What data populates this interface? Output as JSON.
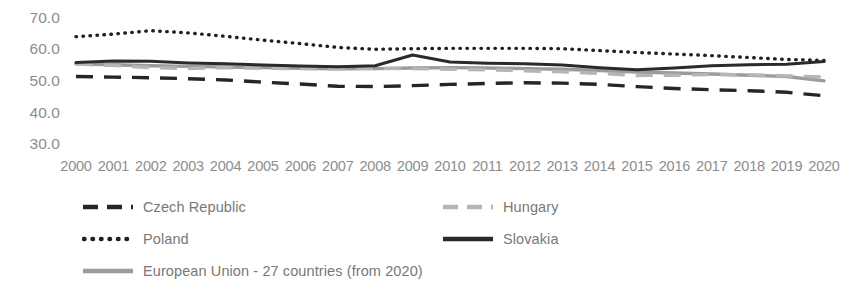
{
  "chart_data": {
    "type": "line",
    "title": "",
    "subtitle": "",
    "xlabel": "",
    "ylabel": "",
    "grid": false,
    "legend_position": "bottom",
    "ylim": [
      30.0,
      70.0
    ],
    "ytick_labels": [
      "70.0",
      "60.0",
      "50.0",
      "40.0",
      "30.0"
    ],
    "ytick_values": [
      70.0,
      60.0,
      50.0,
      40.0,
      30.0
    ],
    "categories": [
      "2000",
      "2001",
      "2002",
      "2003",
      "2004",
      "2005",
      "2006",
      "2007",
      "2008",
      "2009",
      "2010",
      "2011",
      "2012",
      "2013",
      "2014",
      "2015",
      "2016",
      "2017",
      "2018",
      "2019",
      "2020"
    ],
    "x": [
      2000,
      2001,
      2002,
      2003,
      2004,
      2005,
      2006,
      2007,
      2008,
      2009,
      2010,
      2011,
      2012,
      2013,
      2014,
      2015,
      2016,
      2017,
      2018,
      2019,
      2020
    ],
    "series": [
      {
        "name": "Czech Republic",
        "style": "dashed",
        "color": "#262626",
        "width": 3.4,
        "values": [
          51.4,
          51.2,
          51.0,
          50.7,
          50.3,
          49.6,
          49.0,
          48.3,
          48.2,
          48.5,
          48.9,
          49.2,
          49.4,
          49.3,
          48.9,
          48.2,
          47.6,
          47.2,
          46.9,
          46.4,
          45.3
        ]
      },
      {
        "name": "Hungary",
        "style": "dashed",
        "color": "#b5b5b5",
        "width": 3.4,
        "values": [
          55.3,
          54.9,
          54.2,
          53.9,
          54.2,
          54.0,
          53.9,
          53.8,
          54.0,
          53.9,
          53.7,
          53.5,
          53.2,
          52.9,
          52.4,
          51.7,
          51.8,
          52.0,
          51.9,
          51.6,
          51.2
        ]
      },
      {
        "name": "Poland",
        "style": "dotted",
        "color": "#1f1f1f",
        "width": 3.4,
        "values": [
          64.0,
          64.8,
          65.9,
          65.2,
          64.1,
          62.9,
          61.8,
          60.6,
          60.0,
          60.2,
          60.3,
          60.3,
          60.3,
          60.2,
          59.6,
          59.0,
          58.5,
          58.0,
          57.4,
          56.8,
          56.5
        ]
      },
      {
        "name": "Slovakia",
        "style": "solid",
        "color": "#2a2a2a",
        "width": 3.0,
        "values": [
          55.8,
          56.3,
          56.2,
          55.7,
          55.4,
          55.0,
          54.7,
          54.5,
          54.8,
          58.2,
          56.0,
          55.6,
          55.4,
          55.0,
          54.2,
          53.5,
          54.1,
          54.8,
          55.1,
          55.3,
          56.1
        ]
      },
      {
        "name": "European Union - 27 countries (from 2020)",
        "style": "solid",
        "color": "#9b9b9b",
        "width": 3.4,
        "values": [
          55.4,
          55.1,
          54.8,
          54.6,
          54.4,
          54.2,
          54.0,
          53.8,
          53.9,
          54.1,
          54.2,
          54.1,
          53.9,
          53.7,
          53.3,
          52.8,
          52.5,
          52.2,
          51.8,
          51.4,
          50.0
        ]
      }
    ]
  },
  "legend": {
    "items": [
      {
        "label": "Czech Republic",
        "marker": "dashed-dark-line-swatch"
      },
      {
        "label": "Hungary",
        "marker": "dashed-light-gray-line-swatch"
      },
      {
        "label": "Poland",
        "marker": "dotted-dark-line-swatch"
      },
      {
        "label": "Slovakia",
        "marker": "solid-dark-line-swatch"
      },
      {
        "label": "European Union - 27 countries (from 2020)",
        "marker": "solid-gray-line-swatch"
      }
    ]
  }
}
